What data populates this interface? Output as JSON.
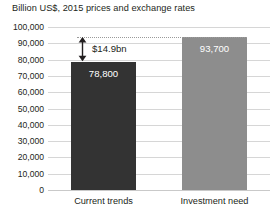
{
  "chart_data": {
    "type": "bar",
    "title": "Billion US$, 2015 prices and exchange rates",
    "xlabel": "",
    "ylabel": "",
    "categories": [
      "Current trends",
      "Investment need"
    ],
    "values": [
      78800,
      93700
    ],
    "value_labels": [
      "78,800",
      "93,700"
    ],
    "series": [
      {
        "name": "Infrastructure investment",
        "values": [
          78800,
          93700
        ]
      }
    ],
    "ylim": [
      0,
      100000
    ],
    "ytick_values": [
      0,
      10000,
      20000,
      30000,
      40000,
      50000,
      60000,
      70000,
      80000,
      90000,
      100000
    ],
    "ytick_labels": [
      "0",
      "10,000",
      "20,000",
      "30,000",
      "40,000",
      "50,000",
      "60,000",
      "70,000",
      "80,000",
      "90,000",
      "100,000"
    ],
    "grid": true,
    "legend": false,
    "annotations": [
      {
        "name": "investment-gap",
        "label": "$14.9bn",
        "from_value": 78800,
        "to_value": 93700,
        "reference_line_value": 93700,
        "style": "double-headed-arrow"
      }
    ],
    "bar_colors": [
      "#333333",
      "#8d8d8d"
    ]
  },
  "colors": {
    "bar_dark": "#333333",
    "bar_light": "#8d8d8d",
    "gridline": "#d6d6d6",
    "text": "#231f20",
    "value_text": "#ffffff",
    "reference_line": "#9a9a9a"
  }
}
